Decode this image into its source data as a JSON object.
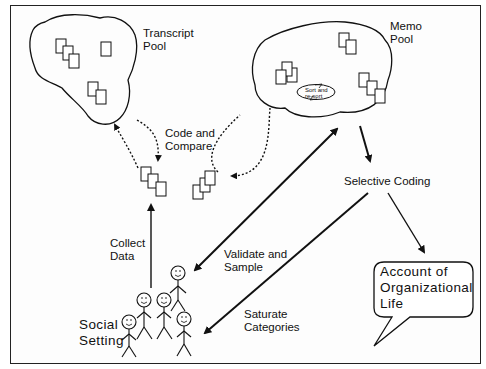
{
  "diagram": {
    "nodes": {
      "transcript_pool": {
        "label": "Transcript\nPool"
      },
      "memo_pool": {
        "label": "Memo\nPool",
        "inner_label": "Sort and\nre-sort"
      },
      "selective_coding": {
        "label": "Selective Coding"
      },
      "account": {
        "label": "Account of\nOrganizational\nLife"
      },
      "social_setting": {
        "label": "Social\nSetting"
      }
    },
    "edges": {
      "code_and_compare": {
        "label": "Code and\nCompare",
        "style": "dotted"
      },
      "collect_data": {
        "label": "Collect\nData",
        "style": "solid"
      },
      "validate_and_sample": {
        "label": "Validate and\nSample",
        "style": "solid-bidirectional"
      },
      "saturate_categories": {
        "label": "Saturate\nCategories",
        "style": "solid"
      }
    },
    "colors": {
      "ink": "#111111",
      "background": "#fdfdfd"
    }
  }
}
